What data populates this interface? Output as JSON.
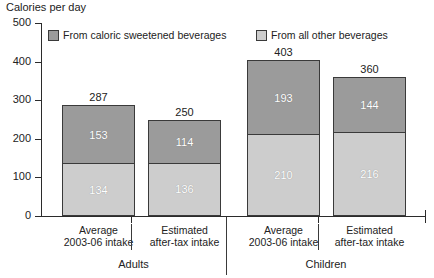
{
  "chart_data": {
    "type": "bar",
    "title": "Calories per day",
    "xlabel": "",
    "ylabel": "Calories per day",
    "ylim": [
      0,
      500
    ],
    "yticks": [
      0,
      100,
      200,
      300,
      400,
      500
    ],
    "grid": false,
    "stacked": true,
    "legend_position": "top",
    "categories": [
      "Average 2003-06 intake",
      "Estimated after-tax intake",
      "Average 2003-06 intake",
      "Estimated after-tax intake"
    ],
    "groups": [
      {
        "label": "Adults",
        "category_indices": [
          0,
          1
        ]
      },
      {
        "label": "Children",
        "category_indices": [
          2,
          3
        ]
      }
    ],
    "series": [
      {
        "name": "From all other beverages",
        "color": "#cdcdcd",
        "values": [
          134,
          136,
          210,
          216
        ]
      },
      {
        "name": "From caloric sweetened beverages",
        "color": "#9b9b9b",
        "values": [
          153,
          114,
          193,
          144
        ]
      }
    ],
    "totals": [
      287,
      250,
      403,
      360
    ]
  },
  "legend": {
    "items": [
      {
        "label": "From caloric sweetened beverages",
        "swatch": "dark"
      },
      {
        "label": "From all other beverages",
        "swatch": "light"
      }
    ]
  },
  "axis": {
    "title": "Calories per day",
    "y_tick_labels": [
      "500",
      "400",
      "300",
      "200",
      "100",
      "0"
    ]
  },
  "bars": [
    {
      "total": "287",
      "dark_value": "153",
      "light_value": "134",
      "line1": "Average",
      "line2": "2003-06 intake"
    },
    {
      "total": "250",
      "dark_value": "114",
      "light_value": "136",
      "line1": "Estimated",
      "line2": "after-tax intake"
    },
    {
      "total": "403",
      "dark_value": "193",
      "light_value": "210",
      "line1": "Average",
      "line2": "2003-06 intake"
    },
    {
      "total": "360",
      "dark_value": "144",
      "light_value": "216",
      "line1": "Estimated",
      "line2": "after-tax intake"
    }
  ],
  "groups": [
    {
      "label": "Adults"
    },
    {
      "label": "Children"
    }
  ]
}
